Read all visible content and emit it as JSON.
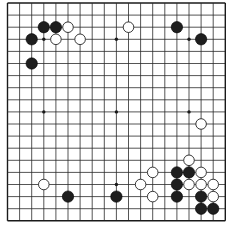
{
  "board": {
    "size": 19,
    "origin_x": 7.5,
    "origin_y": 3,
    "spacing": 12.1,
    "line_color": "#2a2a2a",
    "border_color": "#1a1a1a",
    "background": "#ffffff",
    "star_points": [
      [
        3,
        3
      ],
      [
        9,
        3
      ],
      [
        15,
        3
      ],
      [
        3,
        9
      ],
      [
        9,
        9
      ],
      [
        15,
        9
      ],
      [
        3,
        15
      ],
      [
        9,
        15
      ],
      [
        15,
        15
      ]
    ]
  },
  "stones": {
    "black_color": "#1e1e1e",
    "white_color": "#ffffff",
    "black": [
      [
        3,
        2
      ],
      [
        4,
        2
      ],
      [
        2,
        3
      ],
      [
        2,
        5
      ],
      [
        14,
        2
      ],
      [
        16,
        3
      ],
      [
        5,
        16
      ],
      [
        9,
        16
      ],
      [
        14,
        14
      ],
      [
        15,
        14
      ],
      [
        14,
        15
      ],
      [
        14,
        16
      ],
      [
        16,
        16
      ],
      [
        16,
        17
      ],
      [
        17,
        17
      ]
    ],
    "white": [
      [
        5,
        2
      ],
      [
        4,
        3
      ],
      [
        6,
        3
      ],
      [
        10,
        2
      ],
      [
        16,
        10
      ],
      [
        3,
        15
      ],
      [
        15,
        13
      ],
      [
        12,
        14
      ],
      [
        16,
        14
      ],
      [
        11,
        15
      ],
      [
        15,
        15
      ],
      [
        16,
        15
      ],
      [
        17,
        15
      ],
      [
        12,
        16
      ],
      [
        17,
        16
      ]
    ]
  }
}
